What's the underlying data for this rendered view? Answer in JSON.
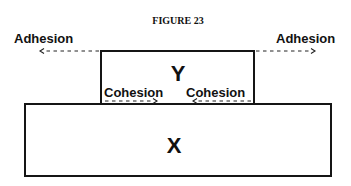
{
  "figure": {
    "title": "FIGURE 23",
    "top_block": {
      "label": "Y"
    },
    "bottom_block": {
      "label": "X"
    },
    "forces": {
      "adhesion_left": {
        "label": "Adhesion",
        "direction": "left"
      },
      "adhesion_right": {
        "label": "Adhesion",
        "direction": "right"
      },
      "cohesion_left": {
        "label": "Cohesion",
        "direction": "right"
      },
      "cohesion_right": {
        "label": "Cohesion",
        "direction": "left"
      }
    },
    "colors": {
      "stroke": "#151515",
      "background": "#ffffff"
    }
  }
}
